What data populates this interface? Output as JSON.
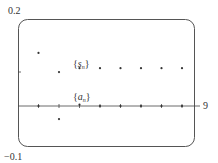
{
  "chart_data": {
    "type": "scatter",
    "title": "",
    "xlabel": "",
    "ylabel": "",
    "xlim": [
      0,
      9
    ],
    "ylim": [
      -0.1,
      0.2
    ],
    "x_tick_labels": [
      "9"
    ],
    "y_tick_labels": [
      "0.2",
      "-0.1"
    ],
    "grid": false,
    "legend": "inline annotations",
    "annotations": [
      {
        "text_open": "{",
        "text_var": "s",
        "text_sub": "n",
        "text_close": "}",
        "near_x": 3,
        "near_y": 0.1
      },
      {
        "text_open": "{",
        "text_var": "a",
        "text_sub": "n",
        "text_close": "}",
        "near_x": 3,
        "near_y": 0.01
      }
    ],
    "x": [
      1,
      2,
      3,
      4,
      5,
      6,
      7,
      8
    ],
    "series": [
      {
        "name": "{s_n}",
        "values": [
          0.122,
          0.078,
          0.087,
          0.087,
          0.087,
          0.087,
          0.087,
          0.087
        ]
      },
      {
        "name": "{a_n}",
        "values": [
          0.0,
          -0.03,
          0.003,
          0.0,
          0.0,
          0.0,
          0.0,
          0.0
        ]
      }
    ]
  },
  "labels": {
    "y_max": "0.2",
    "y_min": "−0.1",
    "x_max": "9",
    "s_open": "{",
    "s_var": "s",
    "s_sub": "n",
    "s_close": "}",
    "a_open": "{",
    "a_var": "a",
    "a_sub": "n",
    "a_close": "}"
  }
}
